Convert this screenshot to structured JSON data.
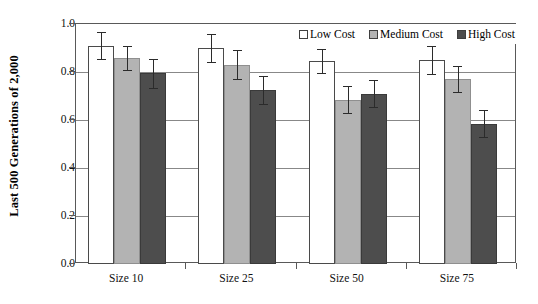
{
  "chart_data": {
    "type": "bar",
    "title": "",
    "xlabel": "",
    "ylabel": "Last 500 Generations of 2,000",
    "ylim": [
      0.0,
      1.0
    ],
    "ytick_labels": [
      "0.0",
      "0.2",
      "0.4",
      "0.6",
      "0.8",
      "1.0"
    ],
    "ytick_values": [
      0.0,
      0.2,
      0.4,
      0.6,
      0.8,
      1.0
    ],
    "grid": true,
    "legend_position": "top-right",
    "categories": [
      "Size 10",
      "Size 25",
      "Size 50",
      "Size 75"
    ],
    "series": [
      {
        "name": "Low Cost",
        "color": "#ffffff",
        "values": [
          0.91,
          0.9,
          0.845,
          0.85
        ],
        "errors": [
          0.055,
          0.06,
          0.05,
          0.06
        ]
      },
      {
        "name": "Medium Cost",
        "color": "#b3b3b3",
        "values": [
          0.86,
          0.83,
          0.685,
          0.77
        ],
        "errors": [
          0.05,
          0.06,
          0.055,
          0.055
        ]
      },
      {
        "name": "High Cost",
        "color": "#4d4d4d",
        "values": [
          0.795,
          0.725,
          0.71,
          0.585
        ],
        "errors": [
          0.06,
          0.06,
          0.055,
          0.055
        ]
      }
    ]
  },
  "legend": {
    "items": [
      {
        "label": "Low Cost",
        "swatch": "#ffffff"
      },
      {
        "label": "Medium Cost",
        "swatch": "#b3b3b3"
      },
      {
        "label": "High Cost",
        "swatch": "#4d4d4d"
      }
    ]
  },
  "caption": ""
}
